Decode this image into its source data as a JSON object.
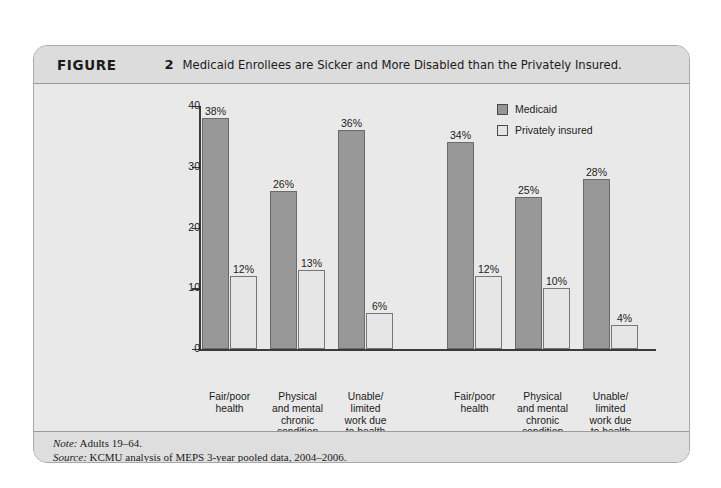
{
  "figure": {
    "label": "FIGURE",
    "number": "2",
    "title": "Medicaid Enrollees are Sicker and More Disabled than the Privately Insured."
  },
  "footer": {
    "note_key": "Note:",
    "note_text": " Adults 19–64.",
    "source_key": "Source:",
    "source_text": " KCMU analysis of MEPS 3-year pooled data, 2004–2006."
  },
  "colors": {
    "medicaid": "#969696",
    "private": "#e6e6e6",
    "card_bg": "#e8e8e8",
    "header_bg": "#dcdcdc",
    "axis": "#3b3b3b"
  },
  "chart_data": {
    "type": "bar",
    "title": "Medicaid Enrollees are Sicker and More Disabled than the Privately Insured.",
    "xlabel": "",
    "ylabel": "",
    "ylim": [
      0,
      40
    ],
    "yticks": [
      0,
      10,
      20,
      30,
      40
    ],
    "ytick_labels": [
      "0",
      "10",
      "20",
      "30",
      "40"
    ],
    "grid": false,
    "legend_position": "top-right",
    "value_suffix": "%",
    "legend": [
      {
        "name": "Medicaid",
        "swatch": "medicaid"
      },
      {
        "name": "Privately insured",
        "swatch": "private"
      }
    ],
    "groups": [
      {
        "title": "Poor",
        "subtitle": "(<100% FPL)",
        "categories": [
          "Fair/poor\nhealth",
          "Physical\nand mental\nchronic\ncondition",
          "Unable/\nlimited\nwork due\nto health"
        ],
        "series": [
          {
            "name": "Medicaid",
            "values": [
              38,
              26,
              36
            ],
            "labels": [
              "38%",
              "26%",
              "36%"
            ]
          },
          {
            "name": "Privately insured",
            "values": [
              12,
              13,
              6
            ],
            "labels": [
              "12%",
              "13%",
              "6%"
            ]
          }
        ]
      },
      {
        "title": "Near poor",
        "subtitle": "(100–199% FPL)",
        "categories": [
          "Fair/poor\nhealth",
          "Physical\nand mental\nchronic\ncondition",
          "Unable/\nlimited\nwork due\nto health"
        ],
        "series": [
          {
            "name": "Medicaid",
            "values": [
              34,
              25,
              28
            ],
            "labels": [
              "34%",
              "25%",
              "28%"
            ]
          },
          {
            "name": "Privately insured",
            "values": [
              12,
              10,
              4
            ],
            "labels": [
              "12%",
              "10%",
              "4%"
            ]
          }
        ]
      }
    ]
  }
}
